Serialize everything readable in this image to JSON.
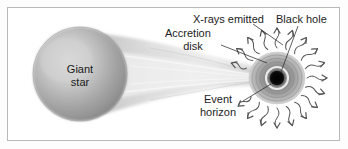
{
  "figure": {
    "background_color": "#ffffff",
    "border_color": "#b9b9b9",
    "text_color": "#1d1d1d"
  },
  "labels": {
    "giant_star_line1": "Giant",
    "giant_star_line2": "star",
    "xrays_emitted": "X-rays emitted",
    "black_hole": "Black hole",
    "accretion_line1": "Accretion",
    "accretion_line2": "disk",
    "event_line1": "Event",
    "event_line2": "horizon"
  },
  "diagram_elements": {
    "giant_star": {
      "name": "giant-star-sphere",
      "center_x": 80,
      "center_y": 74,
      "radius": 47,
      "fill_light": "#d8d8d8",
      "fill_mid": "#b0b0b0",
      "fill_dark": "#8a8a8a"
    },
    "accretion_stream": {
      "name": "accretion-stream",
      "from_x": 118,
      "to_x": 268,
      "fill": "#e6e6e6"
    },
    "accretion_disk": {
      "name": "accretion-disk",
      "center_x": 277,
      "center_y": 78,
      "radius_x": 28,
      "radius_y": 26,
      "fill": "#9a9a9a"
    },
    "event_horizon_ring": {
      "name": "event-horizon-ring",
      "center_x": 277,
      "center_y": 78,
      "radius": 11,
      "stroke": "#f2f2f2"
    },
    "black_hole_core": {
      "name": "black-hole-core",
      "center_x": 277,
      "center_y": 78,
      "radius": 7,
      "fill": "#0a0a0a"
    },
    "xray_arrows": {
      "name": "xray-arrow",
      "count": 20,
      "color": "#5a5a5a",
      "inner_radius": 30,
      "outer_radius": 54
    }
  },
  "leader_lines": [
    {
      "name": "leader-xrays",
      "from_x": 253,
      "from_y": 24,
      "to_x": 283,
      "to_y": 44
    },
    {
      "name": "leader-black-hole",
      "from_x": 297,
      "from_y": 26,
      "to_x": 281,
      "to_y": 72
    },
    {
      "name": "leader-accretion-disk",
      "from_x": 220,
      "from_y": 44,
      "to_x": 266,
      "to_y": 62
    },
    {
      "name": "leader-event-horizon",
      "from_x": 243,
      "from_y": 101,
      "to_x": 271,
      "to_y": 84
    }
  ]
}
